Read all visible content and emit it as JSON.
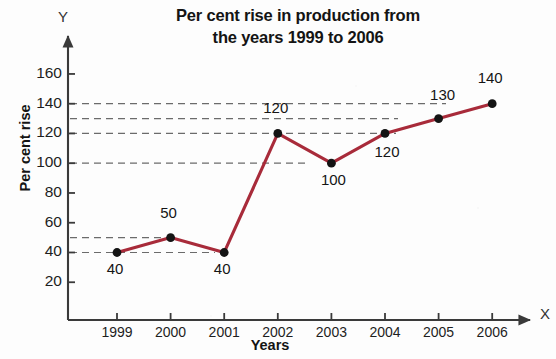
{
  "chart_data": {
    "type": "line",
    "title": "Per cent rise in production from the years 1999 to 2006",
    "title_lines": [
      "Per cent rise in production from",
      "the years 1999 to 2006"
    ],
    "xlabel": "Years",
    "ylabel": "Per cent rise",
    "axis_letter_x": "X",
    "axis_letter_y": "Y",
    "categories": [
      "1999",
      "2000",
      "2001",
      "2002",
      "2003",
      "2004",
      "2005",
      "2006"
    ],
    "values": [
      40,
      50,
      40,
      120,
      100,
      120,
      130,
      140
    ],
    "point_labels": [
      "40",
      "50",
      "40",
      "120",
      "100",
      "120",
      "130",
      "140"
    ],
    "ylim": [
      0,
      170
    ],
    "xlim": [
      0,
      9
    ],
    "yticks": [
      20,
      40,
      60,
      80,
      100,
      120,
      140,
      160
    ],
    "ytick_labels": [
      "20",
      "40",
      "60",
      "80",
      "100",
      "120",
      "140",
      "160"
    ],
    "gridlines": [
      40,
      50,
      100,
      120,
      130,
      140
    ],
    "grid": "horizontal-dashed",
    "legend": "none",
    "colors": {
      "line": "#A82B3A",
      "marker": "#141414",
      "axis": "#3a3a3a",
      "grid": "#6b6b6b",
      "background": "#fdfdfd",
      "text": "#141414"
    }
  }
}
